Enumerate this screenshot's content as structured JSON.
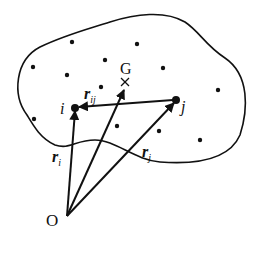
{
  "diagram": {
    "origin_label": "O",
    "center_label": "G",
    "particle_i_label": "i",
    "particle_j_label": "j",
    "vectors": {
      "r_i": {
        "base": "r",
        "sub": "i"
      },
      "r_j": {
        "base": "r",
        "sub": "j"
      },
      "r_ij": {
        "base": "r",
        "sub": "ij"
      }
    },
    "colors": {
      "ink": "#111111",
      "background": "#ffffff"
    },
    "dots": [
      [
        72,
        42
      ],
      [
        137,
        44
      ],
      [
        33,
        67
      ],
      [
        67,
        75
      ],
      [
        105,
        60
      ],
      [
        163,
        68
      ],
      [
        101,
        87
      ],
      [
        218,
        90
      ],
      [
        34,
        119
      ],
      [
        117,
        126
      ],
      [
        159,
        131
      ],
      [
        200,
        140
      ]
    ]
  }
}
